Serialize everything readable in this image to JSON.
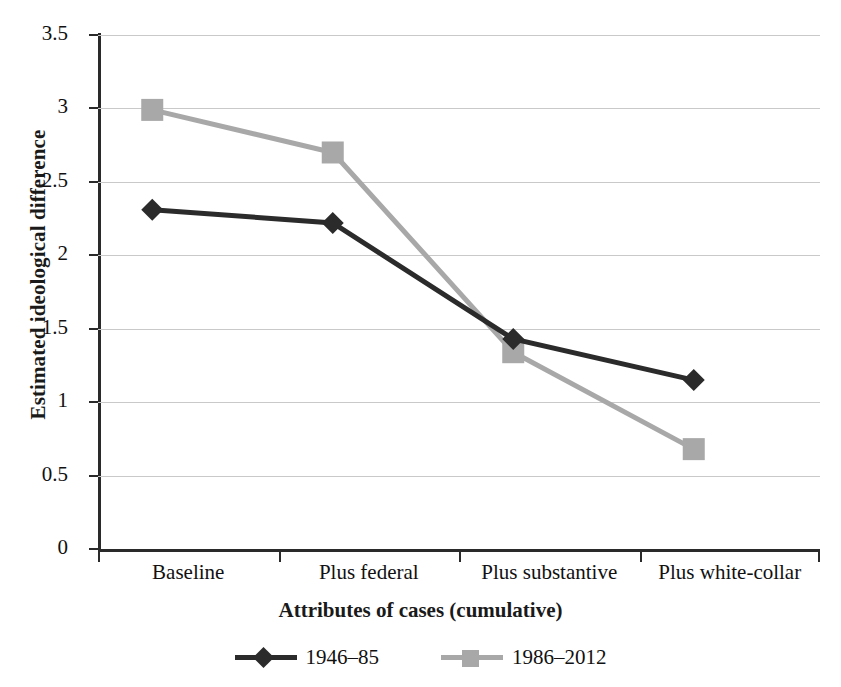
{
  "top_caption": "",
  "chart_data": {
    "type": "line",
    "title": "",
    "xlabel": "Attributes of cases (cumulative)",
    "ylabel": "Estimated ideological difference",
    "categories": [
      "Baseline",
      "Plus federal",
      "Plus substantive",
      "Plus white-collar"
    ],
    "ylim": [
      0,
      3.5
    ],
    "ytick_labels": [
      "0",
      "0.5",
      "1",
      "1.5",
      "2",
      "2.5",
      "3",
      "3.5"
    ],
    "ytick_values": [
      0,
      0.5,
      1,
      1.5,
      2,
      2.5,
      3,
      3.5
    ],
    "grid": true,
    "legend_position": "bottom",
    "series": [
      {
        "name": "1946–85",
        "color": "#2b2b2b",
        "marker": "diamond",
        "values": [
          2.31,
          2.22,
          1.43,
          1.15
        ]
      },
      {
        "name": "1986–2012",
        "color": "#a8a8a8",
        "marker": "square",
        "values": [
          2.99,
          2.7,
          1.34,
          0.68
        ]
      }
    ]
  },
  "colors": {
    "series_1946_85": "#2b2b2b",
    "series_1986_2012": "#a8a8a8",
    "axis": "#2a2a2a",
    "gridline": "#c9c9c9",
    "background": "#ffffff"
  }
}
